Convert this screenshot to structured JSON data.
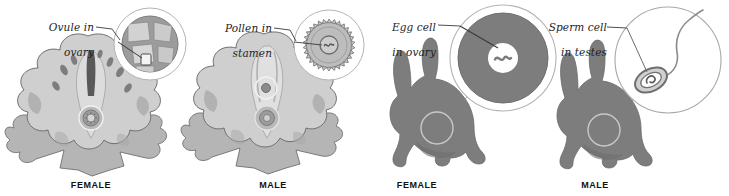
{
  "figure": {
    "background": "#ffffff"
  },
  "colors": {
    "line": "#8c8c8c",
    "leader_line": "#9a9a9a",
    "dark_leader": "#3b3b3b",
    "text": "#1d1d1d",
    "caption_text": "#111111",
    "flower_light": "#cfcfcf",
    "flower_mid": "#b5b5b5",
    "flower_dark": "#8f8f8f",
    "flower_outline": "#6f6f6f",
    "rabbit_gray": "#7d7d7d",
    "rabbit_outline": "#6a6a6a",
    "egg_fill": "#7d7d7d",
    "nucleus_white": "#ffffff",
    "magnifier_ring": "#9d9d9d",
    "ovary_fill": "#9c9c9c",
    "ovule_light": "#d8d8d8",
    "pollen_fill": "#c6c6c6",
    "sperm_outline": "#6f6f6f"
  },
  "panels": [
    {
      "id": "ovule-in-ovary",
      "organism": "flower",
      "callout": "Ovule in\novary",
      "callout_line1": "Ovule in",
      "callout_line2": "ovary",
      "caption": "FEMALE",
      "magnifier_shows": "ovary-cross-section-with-ovules",
      "magnifier_center": [
        150,
        44
      ],
      "magnifier_radius": 36,
      "source_marker": [
        110,
        96
      ]
    },
    {
      "id": "pollen-in-stamen",
      "organism": "flower",
      "callout": "Pollen in\nstamen",
      "callout_line1": "Pollen in",
      "callout_line2": "stamen",
      "caption": "MALE",
      "magnifier_shows": "pollen-grain-with-nucleus",
      "magnifier_center": [
        329,
        45
      ],
      "magnifier_radius": 35,
      "source_marker": [
        257,
        91
      ]
    },
    {
      "id": "egg-cell-in-ovary",
      "organism": "rabbit",
      "callout": "Egg cell\nin ovary",
      "callout_line1": "Egg cell",
      "callout_line2": "in ovary",
      "caption": "FEMALE",
      "magnifier_shows": "egg-cell-with-nucleus",
      "magnifier_center": [
        503,
        58
      ],
      "magnifier_radius": 53,
      "source_marker": [
        432,
        128
      ]
    },
    {
      "id": "sperm-cell-in-testes",
      "organism": "rabbit",
      "callout": "Sperm cell\nin testes",
      "callout_line1": "Sperm cell",
      "callout_line2": "in testes",
      "caption": "MALE",
      "magnifier_shows": "sperm-cell-head-and-tail",
      "magnifier_center": [
        668,
        60
      ],
      "magnifier_radius": 53,
      "source_marker": [
        600,
        130
      ]
    }
  ]
}
